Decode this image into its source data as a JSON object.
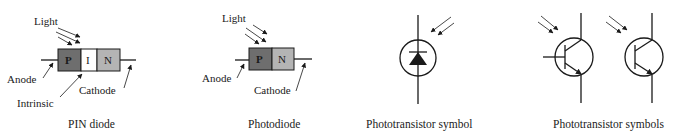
{
  "figures": [
    {
      "id": "pin-diode",
      "caption": "PIN diode",
      "light_label": "Light",
      "regions": [
        {
          "label": "P",
          "color": "#6e6e6e"
        },
        {
          "label": "I",
          "color": "#ffffff"
        },
        {
          "label": "N",
          "color": "#b4b4b4"
        }
      ],
      "anode_label": "Anode",
      "intrinsic_label": "Intrinsic",
      "cathode_label": "Cathode"
    },
    {
      "id": "photodiode",
      "caption": "Photodiode",
      "light_label": "Light",
      "regions": [
        {
          "label": "P",
          "color": "#6e6e6e"
        },
        {
          "label": "N",
          "color": "#b4b4b4"
        }
      ],
      "anode_label": "Anode",
      "cathode_label": "Cathode"
    },
    {
      "id": "phototransistor-symbol",
      "caption": "Phototransistor symbol"
    },
    {
      "id": "phototransistor-symbols",
      "caption": "Phototransistor symbols"
    }
  ],
  "colors": {
    "line": "#1a1a1a",
    "p_region": "#6e6e6e",
    "i_region": "#ffffff",
    "n_region": "#b4b4b4"
  }
}
